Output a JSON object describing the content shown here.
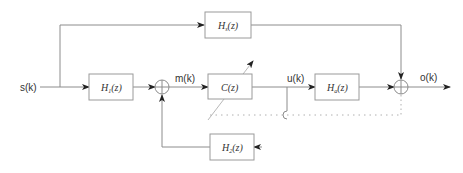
{
  "diagram": {
    "type": "block-diagram",
    "colors": {
      "line": "#8c8c8c",
      "text": "#333333",
      "box_border": "#9a9a9a",
      "dotted": "#b0b0b0"
    },
    "signals": {
      "input": "s(k)",
      "m": "m(k)",
      "u": "u(k)",
      "output": "o(k)"
    },
    "blocks": {
      "top": {
        "base": "H",
        "sub": "s",
        "arg": "(z)"
      },
      "h1": {
        "base": "H",
        "sub": "1",
        "arg": "(z)"
      },
      "c": {
        "base": "C",
        "sub": "",
        "arg": "(z)"
      },
      "ha": {
        "base": "H",
        "sub": "a",
        "arg": "(z)"
      },
      "h2": {
        "base": "H",
        "sub": "2",
        "arg": "(z)"
      }
    },
    "summing_junctions": [
      "sum-1",
      "sum-2"
    ]
  }
}
